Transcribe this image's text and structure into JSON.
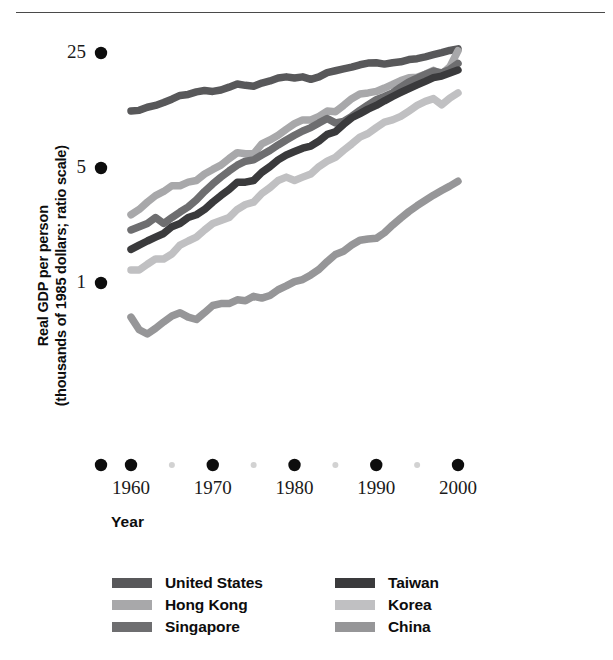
{
  "chart_data": {
    "type": "line",
    "title": "",
    "xlabel": "Year",
    "ylabel": "Real GDP per person (thousands of 1985 dollars; ratio scale)",
    "ylabel_line1": "Real GDP per person",
    "ylabel_line2": "(thousands of 1985 dollars; ratio scale)",
    "scale": "log",
    "grid": false,
    "legend_position": "bottom",
    "xlim": [
      1958,
      2001
    ],
    "ylim": [
      0.42,
      30
    ],
    "xticks": [
      1960,
      1970,
      1980,
      1990,
      2000
    ],
    "xticklabels": [
      "1960",
      "1970",
      "1980",
      "1990",
      "2000"
    ],
    "xminorticks": [
      1965,
      1975,
      1985,
      1995
    ],
    "yticks": [
      1,
      5,
      25
    ],
    "yticklabels": [
      "1",
      "5",
      "25"
    ],
    "x": [
      1960,
      1961,
      1962,
      1963,
      1964,
      1965,
      1966,
      1967,
      1968,
      1969,
      1970,
      1971,
      1972,
      1973,
      1974,
      1975,
      1976,
      1977,
      1978,
      1979,
      1980,
      1981,
      1982,
      1983,
      1984,
      1985,
      1986,
      1987,
      1988,
      1989,
      1990,
      1991,
      1992,
      1993,
      1994,
      1995,
      1996,
      1997,
      1998,
      1999,
      2000
    ],
    "series": [
      {
        "name": "United States",
        "color": "#58585a",
        "values": [
          11.1,
          11.2,
          11.7,
          12.0,
          12.5,
          13.1,
          13.8,
          14.0,
          14.5,
          14.8,
          14.6,
          14.9,
          15.5,
          16.2,
          15.9,
          15.7,
          16.4,
          16.9,
          17.6,
          17.9,
          17.6,
          17.9,
          17.3,
          17.9,
          19.0,
          19.5,
          20.0,
          20.5,
          21.2,
          21.7,
          21.8,
          21.4,
          21.8,
          22.1,
          22.8,
          23.1,
          23.7,
          24.4,
          25.1,
          25.9,
          26.5
        ]
      },
      {
        "name": "Hong Kong",
        "color": "#a8a8aa",
        "values": [
          2.6,
          2.8,
          3.1,
          3.4,
          3.6,
          3.9,
          3.9,
          4.1,
          4.2,
          4.6,
          4.9,
          5.2,
          5.7,
          6.2,
          6.1,
          6.1,
          7.0,
          7.4,
          7.9,
          8.6,
          9.3,
          9.8,
          9.8,
          10.3,
          11.1,
          11.0,
          12.0,
          13.2,
          14.1,
          14.3,
          14.6,
          15.3,
          16.1,
          17.0,
          17.7,
          17.8,
          18.6,
          19.6,
          18.6,
          20.6,
          25.8
        ]
      },
      {
        "name": "Singapore",
        "color": "#6e6e70",
        "values": [
          2.1,
          2.2,
          2.3,
          2.5,
          2.3,
          2.5,
          2.7,
          2.9,
          3.2,
          3.6,
          4.0,
          4.4,
          4.8,
          5.2,
          5.5,
          5.6,
          6.0,
          6.4,
          6.9,
          7.4,
          7.9,
          8.4,
          8.8,
          9.4,
          10.0,
          9.4,
          9.6,
          10.3,
          11.2,
          12.1,
          13.0,
          13.6,
          14.3,
          15.5,
          16.7,
          17.6,
          18.5,
          19.4,
          18.9,
          19.9,
          21.6
        ]
      },
      {
        "name": "Taiwan",
        "color": "#3a3a3c",
        "values": [
          1.6,
          1.7,
          1.8,
          1.9,
          2.0,
          2.2,
          2.3,
          2.5,
          2.6,
          2.8,
          3.1,
          3.4,
          3.7,
          4.1,
          4.1,
          4.2,
          4.7,
          5.1,
          5.6,
          6.0,
          6.3,
          6.6,
          6.8,
          7.3,
          8.0,
          8.3,
          9.2,
          10.1,
          10.7,
          11.4,
          12.0,
          12.8,
          13.6,
          14.4,
          15.2,
          16.0,
          16.8,
          17.7,
          18.1,
          18.9,
          19.7
        ]
      },
      {
        "name": "Korea",
        "color": "#c0c0c2",
        "values": [
          1.2,
          1.2,
          1.3,
          1.4,
          1.4,
          1.5,
          1.7,
          1.8,
          1.9,
          2.1,
          2.3,
          2.4,
          2.5,
          2.8,
          3.0,
          3.1,
          3.5,
          3.8,
          4.2,
          4.4,
          4.2,
          4.4,
          4.6,
          5.1,
          5.5,
          5.8,
          6.4,
          7.0,
          7.7,
          8.1,
          8.8,
          9.5,
          9.8,
          10.3,
          11.1,
          12.0,
          12.7,
          13.2,
          12.1,
          13.3,
          14.3
        ]
      },
      {
        "name": "China",
        "color": "#969698",
        "values": [
          0.62,
          0.52,
          0.49,
          0.53,
          0.58,
          0.63,
          0.66,
          0.62,
          0.6,
          0.66,
          0.73,
          0.75,
          0.75,
          0.79,
          0.78,
          0.83,
          0.81,
          0.84,
          0.91,
          0.96,
          1.02,
          1.05,
          1.12,
          1.21,
          1.35,
          1.49,
          1.56,
          1.7,
          1.82,
          1.85,
          1.87,
          2.02,
          2.25,
          2.48,
          2.72,
          2.95,
          3.18,
          3.42,
          3.65,
          3.88,
          4.15
        ]
      }
    ]
  },
  "legend": {
    "columns": [
      {
        "items": [
          {
            "label": "United States",
            "color": "#58585a"
          },
          {
            "label": "Hong Kong",
            "color": "#a8a8aa"
          },
          {
            "label": "Singapore",
            "color": "#6e6e70"
          }
        ]
      },
      {
        "items": [
          {
            "label": "Taiwan",
            "color": "#3a3a3c"
          },
          {
            "label": "Korea",
            "color": "#c0c0c2"
          },
          {
            "label": "China",
            "color": "#969698"
          }
        ]
      }
    ]
  },
  "axis": {
    "tick_dot_color": "#0d0d0d",
    "minor_tick_dot_color": "#d2d2d2"
  }
}
